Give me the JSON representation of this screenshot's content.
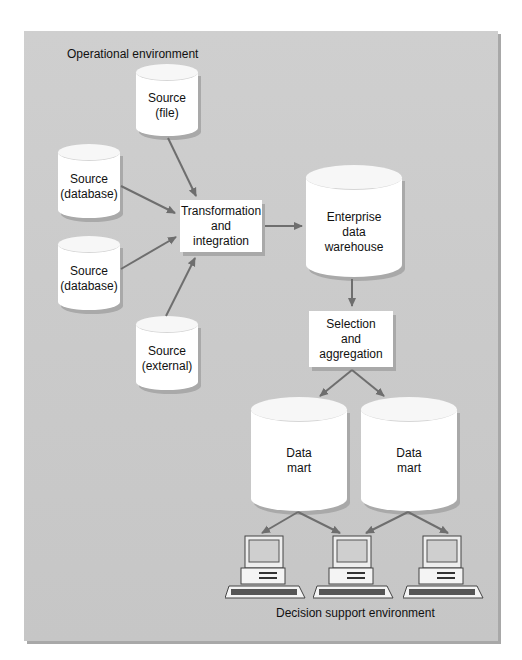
{
  "diagram": {
    "regions": {
      "top": "Operational environment",
      "bottom": "Decision support environment"
    },
    "nodes": {
      "source_file": [
        "Source",
        "(file)"
      ],
      "source_db1": [
        "Source",
        "(database)"
      ],
      "source_db2": [
        "Source",
        "(database)"
      ],
      "source_ext": [
        "Source",
        "(external)"
      ],
      "transform": [
        "Transformation",
        "and",
        "integration"
      ],
      "edw": [
        "Enterprise",
        "data",
        "warehouse"
      ],
      "select": [
        "Selection",
        "and",
        "aggregation"
      ],
      "mart1": [
        "Data",
        "mart"
      ],
      "mart2": [
        "Data",
        "mart"
      ]
    },
    "edges": [
      [
        "source_file",
        "transform"
      ],
      [
        "source_db1",
        "transform"
      ],
      [
        "source_db2",
        "transform"
      ],
      [
        "source_ext",
        "transform"
      ],
      [
        "transform",
        "edw"
      ],
      [
        "edw",
        "select"
      ],
      [
        "select",
        "mart1"
      ],
      [
        "select",
        "mart2"
      ],
      [
        "mart1",
        "pc1"
      ],
      [
        "mart1",
        "pc2"
      ],
      [
        "mart2",
        "pc2"
      ],
      [
        "mart2",
        "pc3"
      ]
    ],
    "colors": {
      "panel": "#cbcbcb",
      "arrow": "#6e6e6e",
      "node": "#ffffff"
    }
  }
}
